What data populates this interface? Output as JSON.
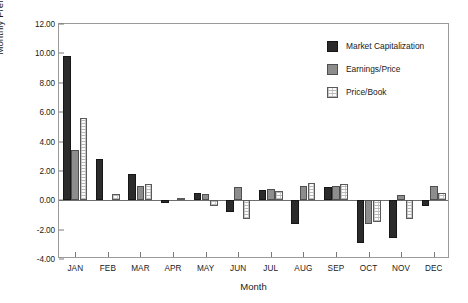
{
  "chart_data": {
    "type": "bar",
    "title": "",
    "xlabel": "Month",
    "ylabel": "Monthly Premia (percent)",
    "categories": [
      "JAN",
      "FEB",
      "MAR",
      "APR",
      "MAY",
      "JUN",
      "JUL",
      "AUG",
      "SEP",
      "OCT",
      "NOV",
      "DEC"
    ],
    "series": [
      {
        "name": "Market Capitalization",
        "color": "#2b2b2b",
        "values": [
          9.85,
          2.8,
          1.8,
          -0.2,
          0.5,
          -0.8,
          0.7,
          -1.6,
          0.9,
          -2.9,
          -2.6,
          -0.4
        ]
      },
      {
        "name": "Earnings/Price",
        "color": "#8d8d8d",
        "values": [
          3.4,
          0.0,
          1.0,
          0.0,
          0.4,
          0.9,
          0.8,
          1.0,
          1.0,
          -1.6,
          0.35,
          1.0
        ]
      },
      {
        "name": "Price/Book",
        "color": "#fbfbfb",
        "values": [
          5.6,
          0.4,
          1.1,
          0.15,
          -0.4,
          -1.3,
          0.6,
          1.2,
          1.1,
          -1.5,
          -1.3,
          0.5
        ]
      }
    ],
    "ylim": [
      -4.0,
      12.0
    ],
    "ytick_step": 2.0,
    "ytick_labels": [
      "12.00",
      "10.00",
      "8.00",
      "6.00",
      "4.00",
      "2.00",
      "0.00",
      "-2.00",
      "-4.00"
    ],
    "grid": false,
    "legend_position": "top-right"
  }
}
